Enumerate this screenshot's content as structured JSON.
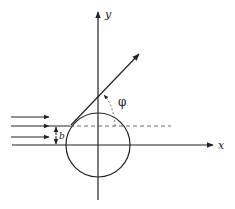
{
  "diagram": {
    "type": "scattering-geometry",
    "labels": {
      "x_axis": "x",
      "y_axis": "y",
      "impact_parameter": "b",
      "scattering_angle": "φ"
    },
    "colors": {
      "line": "#222222",
      "background": "#ffffff"
    },
    "incoming_rays": 4
  }
}
